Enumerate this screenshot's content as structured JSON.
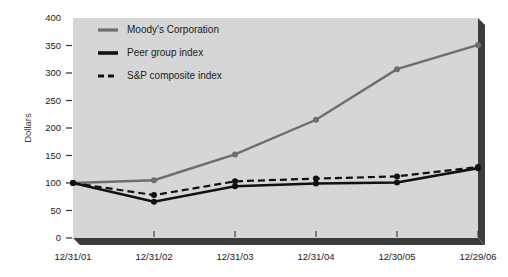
{
  "chart_data": {
    "type": "line",
    "title": "",
    "subtitle": "",
    "xlabel": "",
    "ylabel": "Dollars",
    "categories": [
      "12/31/01",
      "12/31/02",
      "12/31/03",
      "12/31/04",
      "12/30/05",
      "12/29/06"
    ],
    "ylim": [
      0,
      400
    ],
    "yticks": [
      0,
      50,
      100,
      150,
      200,
      250,
      300,
      350,
      400
    ],
    "ytick_labels": [
      "0",
      "50",
      "100",
      "150",
      "200",
      "250",
      "300",
      "350",
      "400"
    ],
    "grid": false,
    "legend_position": "top-left-inside",
    "series": [
      {
        "name": "Moody's Corporation",
        "values": [
          100,
          105,
          152,
          215,
          307,
          351
        ],
        "color": "#6e6e6e",
        "style": "solid",
        "width": 2.4,
        "markers": true
      },
      {
        "name": "Peer group index",
        "values": [
          100,
          66,
          94,
          99,
          101,
          127
        ],
        "color": "#111111",
        "style": "solid",
        "width": 2.6,
        "markers": true
      },
      {
        "name": "S&P composite index",
        "values": [
          100,
          78,
          103,
          108,
          112,
          129
        ],
        "color": "#111111",
        "style": "dashed",
        "width": 2.2,
        "markers": true
      }
    ]
  },
  "plot": {
    "background_color": "#d6d6d6",
    "frame_color": "#3c3c3c",
    "page_background": "#ffffff"
  },
  "legend": {
    "items": [
      {
        "label": "Moody's Corporation",
        "swatch": "moodys-swatch"
      },
      {
        "label": "Peer group index",
        "swatch": "peer-swatch"
      },
      {
        "label": "S&P composite index",
        "swatch": "sp-swatch"
      }
    ]
  },
  "axes": {
    "y_axis_label": "Dollars",
    "y_tick_0": "0",
    "y_tick_50": "50",
    "y_tick_100": "100",
    "y_tick_150": "150",
    "y_tick_200": "200",
    "y_tick_250": "250",
    "y_tick_300": "300",
    "y_tick_350": "350",
    "y_tick_400": "400",
    "x_tick_0": "12/31/01",
    "x_tick_1": "12/31/02",
    "x_tick_2": "12/31/03",
    "x_tick_3": "12/31/04",
    "x_tick_4": "12/30/05",
    "x_tick_5": "12/29/06"
  }
}
